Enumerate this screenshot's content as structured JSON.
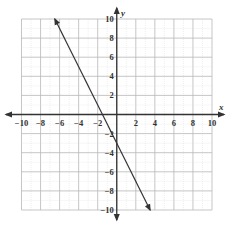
{
  "chart_data": {
    "type": "line",
    "title": "",
    "xlabel": "x",
    "ylabel": "y",
    "xlim": [
      -10,
      10
    ],
    "ylim": [
      -10,
      10
    ],
    "grid": true,
    "grid_step": 2,
    "x_ticks": [
      -10,
      -8,
      -6,
      -4,
      -2,
      2,
      4,
      6,
      8,
      10
    ],
    "y_ticks": [
      -10,
      -8,
      -6,
      -4,
      -2,
      2,
      4,
      6,
      8,
      10
    ],
    "x_tick_labels": [
      "−10",
      "−8",
      "−6",
      "−4",
      "−2",
      "2",
      "4",
      "6",
      "8",
      "10"
    ],
    "y_tick_labels": [
      "−10",
      "−8",
      "−6",
      "−4",
      "−2",
      "2",
      "4",
      "6",
      "8",
      "10"
    ],
    "series": [
      {
        "name": "line",
        "equation": "y = -2x - 3",
        "x": [
          -6.5,
          3.5
        ],
        "y": [
          10,
          -10
        ],
        "arrows": "both",
        "color": "#333333"
      }
    ],
    "intercepts": {
      "x_intercept": -1.5,
      "y_intercept": -3
    }
  }
}
